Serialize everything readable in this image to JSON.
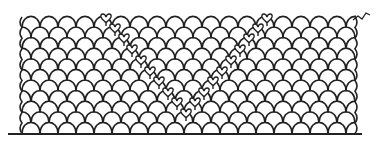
{
  "figure": {
    "title": "",
    "stroke_color": "#222222",
    "background": "#ffffff",
    "stroke_width": 1.6
  },
  "grid": {
    "left": 22,
    "right": 355,
    "top": 17,
    "baseline_y": 134,
    "rows": 11,
    "row_height": 10.6,
    "arc_width": 18,
    "arc_height": 12
  },
  "baseline": {
    "x1": 8,
    "x2": 362,
    "y": 134
  },
  "tail": {
    "points": "353,20 358,16 362,19 366,13 370,15"
  },
  "hearts": [
    {
      "x": 106,
      "y": 15
    },
    {
      "x": 115,
      "y": 25
    },
    {
      "x": 124,
      "y": 35
    },
    {
      "x": 132,
      "y": 46
    },
    {
      "x": 141,
      "y": 57
    },
    {
      "x": 150,
      "y": 68
    },
    {
      "x": 159,
      "y": 78
    },
    {
      "x": 168,
      "y": 89
    },
    {
      "x": 177,
      "y": 99
    },
    {
      "x": 186,
      "y": 110
    },
    {
      "x": 267,
      "y": 15
    },
    {
      "x": 258,
      "y": 25
    },
    {
      "x": 249,
      "y": 35
    },
    {
      "x": 240,
      "y": 46
    },
    {
      "x": 231,
      "y": 57
    },
    {
      "x": 222,
      "y": 68
    },
    {
      "x": 213,
      "y": 78
    },
    {
      "x": 204,
      "y": 89
    },
    {
      "x": 195,
      "y": 99
    }
  ]
}
